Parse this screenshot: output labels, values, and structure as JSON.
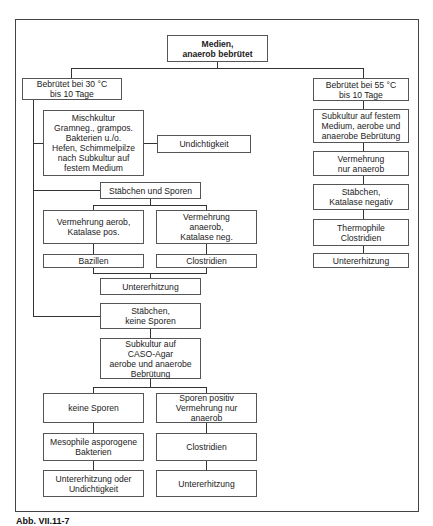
{
  "diagram": {
    "root": {
      "label": "Medien,\nanaerob bebrütet"
    },
    "left_branch": {
      "header": "Bebrütet bei 30 °C\nbis 10 Tage",
      "mischkultur": "Mischkultur\nGramneg., grampos.\nBakterien u./o.\nHefen, Schimmelpilze\nnach Subkultur auf\nfestem Medium",
      "mischkultur_result": "Undichtigkeit",
      "staebchen_sporen": {
        "label": "Stäbchen und Sporen",
        "aerob": "Vermehrung aerob,\nKatalase pos.",
        "anaerob": "Vermehrung\nanaerob,\nKatalase neg.",
        "aerob_result": "Bazillen",
        "anaerob_result": "Clostridien",
        "result": "Untererhitzung"
      },
      "staebchen_keine_sporen": {
        "label": "Stäbchen,\nkeine Sporen",
        "subkultur": "Subkultur auf\nCASO-Agar\naerobe und anaerobe\nBebrütung",
        "keine_sporen": "keine Sporen",
        "sporen_positiv": "Sporen positiv\nVermehrung nur\nanaerob",
        "keine_sporen_org": "Mesophile asporogene\nBakterien",
        "sporen_positiv_org": "Clostridien",
        "keine_sporen_result": "Untererhitzung oder\nUndichtigkeit",
        "sporen_positiv_result": "Untererhitzung"
      }
    },
    "right_branch": {
      "header": "Bebrütet bei 55 °C\nbis 10 Tage",
      "steps": [
        "Subkultur auf festem\nMedium, aerobe und\nanaerobe Bebrütung",
        "Vermehrung\nnur anaerob",
        "Stäbchen,\nKatalase negativ",
        "Thermophile\nClostridien",
        "Untererhitzung"
      ]
    },
    "caption": "Abb. VII.11-7"
  }
}
